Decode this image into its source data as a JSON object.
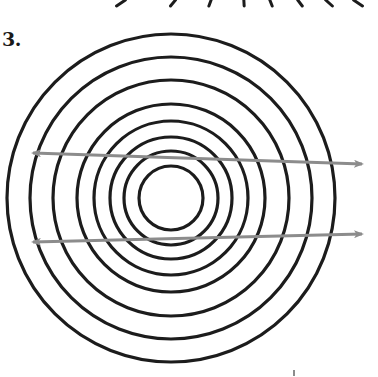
{
  "figure": {
    "problem_number": "3.",
    "center": [
      171,
      198
    ],
    "ring_radii": [
      32,
      47,
      61,
      77,
      94,
      118,
      141,
      164
    ],
    "ring_color": "#1c1c1c",
    "ring_stroke_width": 3.2,
    "arrows": [
      {
        "name": "upper-ray",
        "from": [
          33,
          153
        ],
        "to": [
          362,
          164
        ],
        "color": "#8c8c8c",
        "heads": "both"
      },
      {
        "name": "lower-ray",
        "from": [
          33,
          242
        ],
        "to": [
          362,
          234
        ],
        "color": "#8c8c8c",
        "heads": "both"
      }
    ],
    "top_partial_marks_x": [
      121,
      173,
      210,
      244,
      271,
      300,
      329,
      358
    ],
    "bottom_mark": [
      294,
      374
    ]
  }
}
